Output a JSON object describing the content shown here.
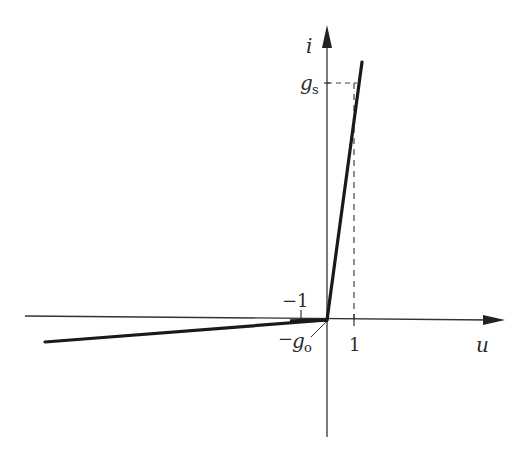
{
  "diagram": {
    "type": "piecewise-linear i-u characteristic",
    "axes": {
      "x_label": "u",
      "y_label": "i",
      "x_tick_labels": [
        "-1",
        "1"
      ],
      "y_tick_labels": [
        "g_s",
        "-g_o"
      ]
    },
    "labels": {
      "i": "i",
      "u": "u",
      "gs_base": "g",
      "gs_sub": "s",
      "go_minus": "−",
      "go_base": "g",
      "go_sub": "o",
      "neg_one": "−1",
      "one": "1"
    },
    "segments": [
      {
        "name": "forward-branch",
        "from": [
          0,
          0
        ],
        "to": [
          1.2,
          1.1
        ],
        "slope_label": "g_s"
      },
      {
        "name": "reverse-branch",
        "from": [
          0,
          0
        ],
        "to": [
          -10.5,
          -0.08
        ],
        "slope_label": "g_o"
      }
    ],
    "colors": {
      "line": "#1a1a1a",
      "axis": "#333333",
      "dashed": "#444444"
    }
  }
}
